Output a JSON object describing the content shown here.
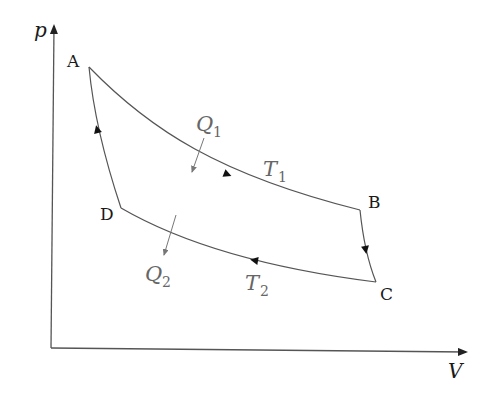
{
  "diagram": {
    "axes": {
      "x_label": "V",
      "y_label": "p"
    },
    "points": {
      "A": "A",
      "B": "B",
      "C": "C",
      "D": "D"
    },
    "heat": {
      "q1": {
        "symbol": "Q",
        "sub": "1"
      },
      "q2": {
        "symbol": "Q",
        "sub": "2"
      }
    },
    "isotherms": {
      "t1": {
        "symbol": "T",
        "sub": "1"
      },
      "t2": {
        "symbol": "T",
        "sub": "2"
      }
    },
    "colors": {
      "curve": "#555555",
      "axis": "#444444",
      "label": "#1a1a1a",
      "math_label": "#666666"
    }
  }
}
